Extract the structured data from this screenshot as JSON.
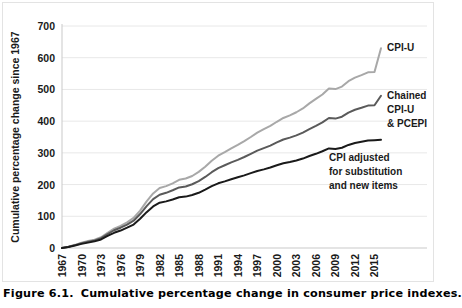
{
  "figure": {
    "caption_number": "Figure 6.1.",
    "caption_text": "Cumulative percentage change in consumer price indexes."
  },
  "chart_data": {
    "type": "line",
    "title": "",
    "xlabel": "",
    "ylabel": "Cumulative percentage change since 1967",
    "ylim": [
      0,
      700
    ],
    "xlim": [
      1967,
      2016
    ],
    "grid": true,
    "legend_position": "inline-right",
    "ytick_labels": [
      "0",
      "100",
      "200",
      "300",
      "400",
      "500",
      "600",
      "700"
    ],
    "ytick_values": [
      0,
      100,
      200,
      300,
      400,
      500,
      600,
      700
    ],
    "xtick_labels": [
      "1967",
      "1970",
      "1973",
      "1976",
      "1979",
      "1982",
      "1985",
      "1988",
      "1991",
      "1994",
      "1997",
      "2000",
      "2003",
      "2006",
      "2009",
      "2012",
      "2015"
    ],
    "xtick_values": [
      1967,
      1970,
      1973,
      1976,
      1979,
      1982,
      1985,
      1988,
      1991,
      1994,
      1997,
      2000,
      2003,
      2006,
      2009,
      2012,
      2015
    ],
    "x": [
      1967,
      1968,
      1969,
      1970,
      1971,
      1972,
      1973,
      1974,
      1975,
      1976,
      1977,
      1978,
      1979,
      1980,
      1981,
      1982,
      1983,
      1984,
      1985,
      1986,
      1987,
      1988,
      1989,
      1990,
      1991,
      1992,
      1993,
      1994,
      1995,
      1996,
      1997,
      1998,
      1999,
      2000,
      2001,
      2002,
      2003,
      2004,
      2005,
      2006,
      2007,
      2008,
      2009,
      2010,
      2011,
      2012,
      2013,
      2014,
      2015,
      2016
    ],
    "series": [
      {
        "name": "CPI-U",
        "color": "#a8a8a8",
        "label_lines": [
          "CPI-U"
        ],
        "values": [
          0,
          4,
          10,
          17,
          22,
          26,
          34,
          48,
          61,
          70,
          81,
          95,
          118,
          147,
          172,
          189,
          195,
          204,
          215,
          219,
          227,
          240,
          256,
          275,
          291,
          302,
          314,
          325,
          337,
          350,
          364,
          375,
          385,
          398,
          410,
          418,
          428,
          440,
          456,
          470,
          484,
          503,
          501,
          509,
          526,
          537,
          545,
          554,
          555,
          630
        ],
        "end_value": 630
      },
      {
        "name": "Chained CPI-U & PCEPI",
        "color": "#5a5a5a",
        "label_lines": [
          "Chained",
          "CPI-U",
          "& PCEPI"
        ],
        "values": [
          0,
          4,
          9,
          15,
          20,
          24,
          31,
          44,
          56,
          64,
          74,
          86,
          107,
          132,
          154,
          168,
          174,
          182,
          191,
          194,
          201,
          211,
          224,
          239,
          252,
          261,
          270,
          278,
          287,
          297,
          307,
          315,
          323,
          333,
          342,
          348,
          355,
          364,
          375,
          385,
          396,
          410,
          408,
          414,
          427,
          436,
          442,
          449,
          450,
          480
        ],
        "end_value": 480
      },
      {
        "name": "CPI adjusted for substitution and new items",
        "color": "#1a1a1a",
        "label_lines": [
          "CPI adjusted",
          "for substitution",
          "and new items"
        ],
        "values": [
          0,
          3,
          8,
          13,
          17,
          21,
          27,
          38,
          48,
          55,
          64,
          74,
          92,
          113,
          131,
          143,
          147,
          153,
          160,
          162,
          167,
          174,
          184,
          195,
          204,
          210,
          217,
          223,
          229,
          236,
          243,
          248,
          254,
          261,
          267,
          271,
          276,
          282,
          290,
          297,
          305,
          314,
          312,
          316,
          325,
          331,
          335,
          339,
          340,
          341
        ],
        "end_value": 341
      }
    ]
  }
}
